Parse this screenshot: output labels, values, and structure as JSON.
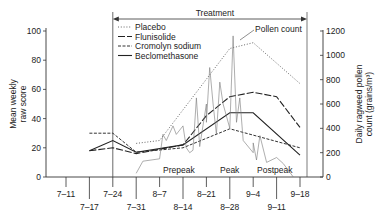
{
  "chart_data": {
    "type": "line",
    "title": "",
    "xlabel": "",
    "ylabel": "Mean weekly raw score",
    "y2label": "Daily ragweed pollen count (grains/m³)",
    "ylim": [
      0,
      100
    ],
    "y2lim": [
      0,
      1200
    ],
    "yticks": [
      0,
      20,
      40,
      60,
      80,
      100
    ],
    "y2ticks": [
      0,
      200,
      400,
      600,
      800,
      1000,
      1200
    ],
    "categories": [
      "7-11",
      "7-17",
      "7-24",
      "7-31",
      "8-7",
      "8-14",
      "8-21",
      "8-28",
      "9-4",
      "9-11",
      "9-18"
    ],
    "grid": false,
    "legend_position": "upper-left",
    "annotations": {
      "treatment": "Treatment",
      "pollen_count": "Pollen count",
      "prepeak": "Prepeak",
      "peak": "Peak",
      "postpeak": "Postpeak"
    },
    "series": [
      {
        "name": "Placebo",
        "style": "dotted",
        "axis": "left",
        "points": [
          [
            "7-31",
            23
          ],
          [
            "8-7",
            25
          ],
          [
            "8-28",
            88
          ],
          [
            "9-4",
            92
          ],
          [
            "9-18",
            64
          ]
        ]
      },
      {
        "name": "Flunisolide",
        "style": "long-dash",
        "axis": "left",
        "points": [
          [
            "7-17",
            18
          ],
          [
            "7-24",
            20
          ],
          [
            "7-31",
            16
          ],
          [
            "8-14",
            22
          ],
          [
            "8-21",
            42
          ],
          [
            "8-28",
            55
          ],
          [
            "9-4",
            58
          ],
          [
            "9-11",
            55
          ],
          [
            "9-18",
            34
          ]
        ]
      },
      {
        "name": "Cromolyn sodium",
        "style": "dashed",
        "axis": "left",
        "points": [
          [
            "7-17",
            30
          ],
          [
            "7-24",
            30
          ],
          [
            "7-31",
            17
          ],
          [
            "8-14",
            20
          ],
          [
            "8-28",
            33
          ],
          [
            "9-18",
            20
          ]
        ]
      },
      {
        "name": "Beclomethasone",
        "style": "solid",
        "axis": "left",
        "points": [
          [
            "7-17",
            18
          ],
          [
            "7-24",
            25
          ],
          [
            "7-31",
            17
          ],
          [
            "8-14",
            22
          ],
          [
            "8-28",
            44
          ],
          [
            "9-4",
            44
          ],
          [
            "9-18",
            15
          ]
        ]
      },
      {
        "name": "Pollen count",
        "style": "thin-solid",
        "axis": "right",
        "points": [
          [
            "7-31",
            30
          ],
          [
            "8-3",
            130
          ],
          [
            "8-7",
            150
          ],
          [
            "8-9",
            350
          ],
          [
            "8-10",
            300
          ],
          [
            "8-12",
            420
          ],
          [
            "8-13",
            350
          ],
          [
            "8-15",
            420
          ],
          [
            "8-16",
            240
          ],
          [
            "8-17",
            200
          ],
          [
            "8-18",
            220
          ],
          [
            "8-19",
            650
          ],
          [
            "8-20",
            250
          ],
          [
            "8-21",
            600
          ],
          [
            "8-22",
            450
          ],
          [
            "8-23",
            900
          ],
          [
            "8-24",
            600
          ],
          [
            "8-25",
            350
          ],
          [
            "8-26",
            780
          ],
          [
            "8-27",
            600
          ],
          [
            "8-28",
            400
          ],
          [
            "8-30",
            1160
          ],
          [
            "8-31",
            450
          ],
          [
            "9-1",
            650
          ],
          [
            "9-2",
            300
          ],
          [
            "9-4",
            200
          ],
          [
            "9-5",
            280
          ],
          [
            "9-6",
            140
          ],
          [
            "9-7",
            340
          ],
          [
            "9-9",
            120
          ],
          [
            "9-11",
            160
          ],
          [
            "9-14",
            110
          ],
          [
            "9-17",
            0
          ]
        ]
      }
    ]
  }
}
